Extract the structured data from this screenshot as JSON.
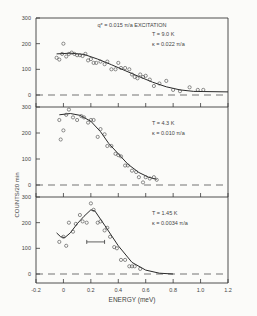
{
  "figure": {
    "ylabel": "COUNTS/20 min",
    "xlabel": "ENERGY (meV)",
    "xticks": [
      "-0.2",
      "0",
      "0.2",
      "0.4",
      "0.6",
      "0.8",
      "1.0",
      "1.2"
    ],
    "yticks": [
      "0",
      "100",
      "200",
      "300"
    ],
    "title": "q* = 0.015 π/a   EXCITATION"
  },
  "chart_data": [
    {
      "type": "scatter",
      "title": "q* = 0.015 π/a EXCITATION",
      "annotation": [
        "T = 9.0 K",
        "κ = 0.022 π/a"
      ],
      "xlabel": "ENERGY (meV)",
      "ylabel": "COUNTS/20 min",
      "xlim": [
        -0.2,
        1.2
      ],
      "ylim": [
        0,
        300
      ],
      "grid": false,
      "points": [
        [
          -0.05,
          145
        ],
        [
          -0.03,
          138
        ],
        [
          -0.01,
          160
        ],
        [
          0.0,
          200
        ],
        [
          0.02,
          150
        ],
        [
          0.04,
          160
        ],
        [
          0.06,
          165
        ],
        [
          0.08,
          160
        ],
        [
          0.1,
          155
        ],
        [
          0.12,
          155
        ],
        [
          0.14,
          152
        ],
        [
          0.16,
          160
        ],
        [
          0.18,
          135
        ],
        [
          0.2,
          140
        ],
        [
          0.22,
          125
        ],
        [
          0.24,
          125
        ],
        [
          0.27,
          130
        ],
        [
          0.3,
          120
        ],
        [
          0.32,
          130
        ],
        [
          0.35,
          100
        ],
        [
          0.38,
          100
        ],
        [
          0.4,
          125
        ],
        [
          0.42,
          105
        ],
        [
          0.45,
          105
        ],
        [
          0.48,
          100
        ],
        [
          0.5,
          80
        ],
        [
          0.52,
          70
        ],
        [
          0.54,
          65
        ],
        [
          0.56,
          80
        ],
        [
          0.58,
          70
        ],
        [
          0.6,
          75
        ],
        [
          0.63,
          60
        ],
        [
          0.66,
          35
        ],
        [
          0.7,
          45
        ],
        [
          0.75,
          55
        ],
        [
          0.8,
          20
        ],
        [
          0.85,
          15
        ],
        [
          0.92,
          30
        ],
        [
          0.98,
          20
        ],
        [
          1.02,
          20
        ]
      ],
      "fit_curve": [
        [
          -0.05,
          160
        ],
        [
          0.05,
          163
        ],
        [
          0.15,
          158
        ],
        [
          0.25,
          140
        ],
        [
          0.35,
          118
        ],
        [
          0.45,
          95
        ],
        [
          0.55,
          72
        ],
        [
          0.65,
          50
        ],
        [
          0.75,
          32
        ],
        [
          0.85,
          20
        ],
        [
          0.95,
          14
        ],
        [
          1.2,
          12
        ]
      ]
    },
    {
      "type": "scatter",
      "annotation": [
        "T = 4.3 K",
        "κ = 0.010 π/a"
      ],
      "xlim": [
        -0.2,
        1.2
      ],
      "ylim": [
        0,
        300
      ],
      "points": [
        [
          -0.03,
          250
        ],
        [
          -0.02,
          175
        ],
        [
          0.0,
          210
        ],
        [
          0.02,
          270
        ],
        [
          0.04,
          290
        ],
        [
          0.07,
          260
        ],
        [
          0.1,
          250
        ],
        [
          0.13,
          265
        ],
        [
          0.15,
          260
        ],
        [
          0.18,
          240
        ],
        [
          0.2,
          250
        ],
        [
          0.22,
          250
        ],
        [
          0.25,
          185
        ],
        [
          0.27,
          215
        ],
        [
          0.3,
          195
        ],
        [
          0.32,
          150
        ],
        [
          0.35,
          150
        ],
        [
          0.38,
          120
        ],
        [
          0.4,
          115
        ],
        [
          0.42,
          110
        ],
        [
          0.45,
          75
        ],
        [
          0.47,
          75
        ],
        [
          0.5,
          55
        ],
        [
          0.53,
          50
        ],
        [
          0.55,
          30
        ],
        [
          0.58,
          10
        ],
        [
          0.6,
          30
        ],
        [
          0.63,
          25
        ],
        [
          0.66,
          30
        ],
        [
          0.68,
          20
        ]
      ],
      "fit_curve": [
        [
          -0.03,
          270
        ],
        [
          0.05,
          275
        ],
        [
          0.12,
          268
        ],
        [
          0.2,
          245
        ],
        [
          0.27,
          205
        ],
        [
          0.33,
          160
        ],
        [
          0.4,
          120
        ],
        [
          0.47,
          80
        ],
        [
          0.55,
          48
        ],
        [
          0.62,
          30
        ],
        [
          0.68,
          22
        ]
      ]
    },
    {
      "type": "scatter",
      "annotation": [
        "T = 1.45 K",
        "κ = 0.0034 π/a"
      ],
      "xlim": [
        -0.2,
        1.2
      ],
      "ylim": [
        0,
        300
      ],
      "points": [
        [
          -0.03,
          125
        ],
        [
          0.0,
          145
        ],
        [
          0.02,
          110
        ],
        [
          0.04,
          200
        ],
        [
          0.07,
          165
        ],
        [
          0.09,
          195
        ],
        [
          0.12,
          230
        ],
        [
          0.14,
          205
        ],
        [
          0.17,
          200
        ],
        [
          0.2,
          275
        ],
        [
          0.22,
          250
        ],
        [
          0.25,
          200
        ],
        [
          0.27,
          205
        ],
        [
          0.3,
          170
        ],
        [
          0.32,
          180
        ],
        [
          0.34,
          145
        ],
        [
          0.37,
          105
        ],
        [
          0.39,
          100
        ],
        [
          0.42,
          55
        ],
        [
          0.45,
          55
        ],
        [
          0.48,
          30
        ],
        [
          0.5,
          30
        ],
        [
          0.52,
          30
        ],
        [
          0.56,
          20
        ]
      ],
      "fit_curve": [
        [
          -0.05,
          160
        ],
        [
          -0.02,
          145
        ],
        [
          0.01,
          142
        ],
        [
          0.05,
          160
        ],
        [
          0.1,
          195
        ],
        [
          0.15,
          225
        ],
        [
          0.2,
          250
        ],
        [
          0.23,
          245
        ],
        [
          0.3,
          190
        ],
        [
          0.4,
          110
        ],
        [
          0.5,
          45
        ],
        [
          0.6,
          15
        ],
        [
          0.7,
          3
        ],
        [
          0.8,
          0
        ]
      ],
      "resolution_bar": {
        "x0": 0.17,
        "x1": 0.3,
        "y": 125
      }
    }
  ]
}
